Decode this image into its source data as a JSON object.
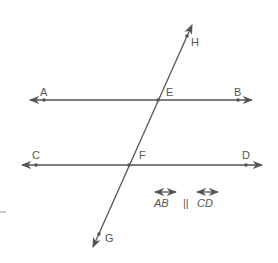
{
  "diagram": {
    "type": "parallel-lines-cut-by-transversal",
    "colors": {
      "line": "#555555",
      "background": "#ffffff"
    },
    "points": {
      "A": {
        "label": "A",
        "x": 44,
        "y": 100
      },
      "B": {
        "label": "B",
        "x": 238,
        "y": 100
      },
      "C": {
        "label": "C",
        "x": 36,
        "y": 165
      },
      "D": {
        "label": "D",
        "x": 246,
        "y": 165
      },
      "E": {
        "label": "E",
        "x": 158,
        "y": 100
      },
      "F": {
        "label": "F",
        "x": 129,
        "y": 165
      },
      "G": {
        "label": "G",
        "x": 99,
        "y": 234
      },
      "H": {
        "label": "H",
        "x": 187,
        "y": 36
      }
    },
    "lines": [
      {
        "name": "line-AB",
        "from": "A",
        "to": "B"
      },
      {
        "name": "line-CD",
        "from": "C",
        "to": "D"
      },
      {
        "name": "transversal-GH",
        "from": "G",
        "to": "H"
      }
    ],
    "statement": {
      "left": "AB",
      "relation": "||",
      "right": "CD"
    }
  }
}
